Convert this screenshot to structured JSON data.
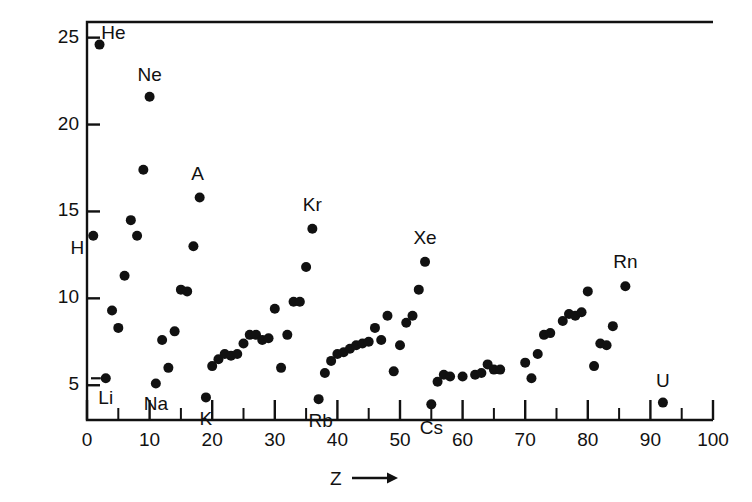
{
  "chart_data": {
    "type": "scatter",
    "title": "",
    "xlabel": "Z",
    "xlabel_suffix": "⟶",
    "ylabel": "Ionization Energy, eV",
    "xlim": [
      0,
      100
    ],
    "ylim": [
      3.0,
      25.9
    ],
    "grid": false,
    "legend": "none",
    "x_ticks_major": [
      0,
      10,
      20,
      30,
      40,
      50,
      60,
      70,
      80,
      90,
      100
    ],
    "x_ticks_minor": [
      5,
      15,
      25,
      35,
      45,
      55,
      65,
      75,
      85,
      95
    ],
    "y_ticks_major": [
      5,
      10,
      15,
      20,
      25
    ],
    "x_tick_labels": [
      "0",
      "10",
      "20",
      "30",
      "40",
      "50",
      "60",
      "70",
      "80",
      "90",
      "100"
    ],
    "y_tick_labels": [
      "5",
      "10",
      "15",
      "20",
      "25"
    ],
    "marker": "filled-circle",
    "marker_color": "#111111",
    "series": [
      {
        "name": "First ionization energy",
        "x": [
          1,
          2,
          3,
          4,
          5,
          6,
          7,
          8,
          9,
          10,
          11,
          12,
          13,
          14,
          15,
          16,
          17,
          18,
          19,
          20,
          21,
          22,
          23,
          24,
          25,
          26,
          27,
          28,
          29,
          30,
          31,
          32,
          33,
          34,
          35,
          36,
          37,
          38,
          39,
          40,
          41,
          42,
          43,
          44,
          45,
          46,
          47,
          48,
          49,
          50,
          51,
          52,
          53,
          54,
          55,
          56,
          57,
          58,
          60,
          62,
          63,
          64,
          65,
          66,
          70,
          71,
          72,
          73,
          74,
          76,
          77,
          78,
          79,
          80,
          81,
          82,
          83,
          84,
          86,
          92
        ],
        "y": [
          13.6,
          24.6,
          5.4,
          9.3,
          8.3,
          11.3,
          14.5,
          13.6,
          17.4,
          21.6,
          5.1,
          7.6,
          6.0,
          8.1,
          10.5,
          10.4,
          13.0,
          15.8,
          4.3,
          6.1,
          6.5,
          6.8,
          6.7,
          6.8,
          7.4,
          7.9,
          7.9,
          7.6,
          7.7,
          9.4,
          6.0,
          7.9,
          9.8,
          9.8,
          11.8,
          14.0,
          4.2,
          5.7,
          6.4,
          6.8,
          6.9,
          7.1,
          7.3,
          7.4,
          7.5,
          8.3,
          7.6,
          9.0,
          5.8,
          7.3,
          8.6,
          9.0,
          10.5,
          12.1,
          3.9,
          5.2,
          5.6,
          5.5,
          5.5,
          5.6,
          5.7,
          6.2,
          5.9,
          5.9,
          6.3,
          5.4,
          6.8,
          7.9,
          8.0,
          8.7,
          9.1,
          9.0,
          9.2,
          10.4,
          6.1,
          7.4,
          7.3,
          8.4,
          10.7,
          4.0
        ]
      }
    ],
    "point_labels": [
      {
        "element": "H",
        "z": 1,
        "e": 13.6
      },
      {
        "element": "He",
        "z": 2,
        "e": 24.6
      },
      {
        "element": "Li",
        "z": 3,
        "e": 5.4
      },
      {
        "element": "Ne",
        "z": 10,
        "e": 21.6
      },
      {
        "element": "Na",
        "z": 11,
        "e": 5.1
      },
      {
        "element": "A",
        "z": 18,
        "e": 15.8
      },
      {
        "element": "K",
        "z": 19,
        "e": 4.3
      },
      {
        "element": "Kr",
        "z": 36,
        "e": 14.0
      },
      {
        "element": "Rb",
        "z": 37,
        "e": 4.2
      },
      {
        "element": "Xe",
        "z": 54,
        "e": 12.1
      },
      {
        "element": "Cs",
        "z": 55,
        "e": 3.9
      },
      {
        "element": "Rn",
        "z": 86,
        "e": 10.7
      },
      {
        "element": "U",
        "z": 92,
        "e": 4.0
      }
    ]
  },
  "axes": {
    "frame_color": "#111111",
    "tick_color": "#111111"
  }
}
